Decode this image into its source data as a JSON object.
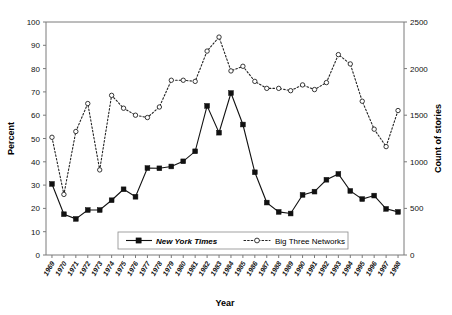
{
  "chart_data": {
    "type": "line",
    "title": "",
    "xlabel": "Year",
    "ylabel": "Percent",
    "ylabel_right": "Count of stories",
    "grid": false,
    "legend_position": "bottom-center",
    "x": [
      1969,
      1970,
      1971,
      1972,
      1973,
      1974,
      1975,
      1976,
      1977,
      1978,
      1979,
      1980,
      1981,
      1982,
      1983,
      1984,
      1985,
      1986,
      1987,
      1988,
      1989,
      1990,
      1991,
      1992,
      1993,
      1994,
      1995,
      1996,
      1997,
      1998
    ],
    "xtick_labels": [
      "1969",
      "1970",
      "1971",
      "1972",
      "1973",
      "1974",
      "1975",
      "1976",
      "1977",
      "1978",
      "1979",
      "1980",
      "1981",
      "1982",
      "1983",
      "1984",
      "1985",
      "1986",
      "1987",
      "1988",
      "1989",
      "1990",
      "1991",
      "1992",
      "1993",
      "1994",
      "1995",
      "1996",
      "1997",
      "1998"
    ],
    "ylim": [
      0,
      100
    ],
    "ytick_labels": [
      "0",
      "10",
      "20",
      "30",
      "40",
      "50",
      "60",
      "70",
      "80",
      "90",
      "100"
    ],
    "yticks": [
      0,
      10,
      20,
      30,
      40,
      50,
      60,
      70,
      80,
      90,
      100
    ],
    "ylim_right": [
      0,
      2500
    ],
    "ytick_labels_right": [
      "0",
      "500",
      "1000",
      "1500",
      "2000",
      "2500"
    ],
    "yticks_right": [
      0,
      500,
      1000,
      1500,
      2000,
      2500
    ],
    "series": [
      {
        "name": "New York Times",
        "axis": "left",
        "marker": "filled-square",
        "linestyle": "solid",
        "color": "#111111",
        "values": [
          30.5,
          17.5,
          15.5,
          19.3,
          19.3,
          23.5,
          28.2,
          25.0,
          37.3,
          37.2,
          38.0,
          40.2,
          44.5,
          64.0,
          52.5,
          69.5,
          56.0,
          35.5,
          22.5,
          18.5,
          17.8,
          25.8,
          27.2,
          32.3,
          34.8,
          27.5,
          24.0,
          25.5,
          19.8,
          18.5
        ]
      },
      {
        "name": "Big Three Networks",
        "axis": "right",
        "marker": "open-circle",
        "linestyle": "dashed",
        "color": "#222222",
        "values_percent_scale": [
          50.5,
          26.0,
          53.0,
          65.0,
          36.5,
          68.5,
          63.0,
          60.0,
          59.0,
          63.5,
          75.0,
          75.0,
          74.5,
          87.5,
          93.5,
          79.0,
          81.0,
          74.5,
          71.5,
          71.5,
          70.5,
          73.0,
          71.0,
          74.0,
          86.0,
          82.0,
          66.0,
          54.0,
          46.5,
          62.0
        ],
        "values": [
          1263,
          650,
          1325,
          1625,
          913,
          1713,
          1575,
          1500,
          1475,
          1588,
          1875,
          1875,
          1863,
          2188,
          2338,
          1975,
          2025,
          1863,
          1788,
          1788,
          1763,
          1825,
          1775,
          1850,
          2150,
          2050,
          1650,
          1350,
          1163,
          1550
        ]
      }
    ]
  },
  "legend": {
    "entries": [
      {
        "label": "New York Times",
        "style": "solid-square"
      },
      {
        "label": "Big Three Networks",
        "style": "dashed-circle"
      }
    ]
  },
  "axes": {
    "left_title": "Percent",
    "right_title": "Count of stories",
    "bottom_title": "Year"
  }
}
